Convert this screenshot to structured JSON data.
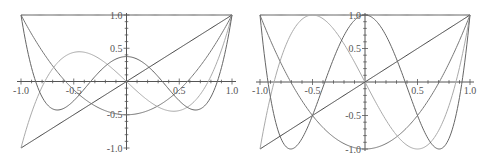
{
  "chart_data": [
    {
      "type": "line",
      "title": "Legendre polynomials P0–P4",
      "xlabel": "",
      "ylabel": "",
      "xlim": [
        -1,
        1
      ],
      "ylim": [
        -1,
        1
      ],
      "grid": false,
      "x_ticks": [
        "-1.0",
        "-0.5",
        "0.5",
        "1.0"
      ],
      "y_ticks": [
        "1.0",
        "0.5",
        "-0.5",
        "-1.0"
      ],
      "series": [
        {
          "name": "P0",
          "coeffs": [
            1
          ],
          "color": "#555555",
          "values_at": {
            "x": [
              -1,
              -0.5,
              0,
              0.5,
              1
            ],
            "y": [
              1,
              1,
              1,
              1,
              1
            ]
          }
        },
        {
          "name": "P1",
          "coeffs": [
            0,
            1
          ],
          "color": "#444444",
          "values_at": {
            "x": [
              -1,
              -0.5,
              0,
              0.5,
              1
            ],
            "y": [
              -1,
              -0.5,
              0,
              0.5,
              1
            ]
          }
        },
        {
          "name": "P2",
          "coeffs": [
            -0.5,
            0,
            1.5
          ],
          "color": "#777777",
          "values_at": {
            "x": [
              -1,
              -0.5,
              0,
              0.5,
              1
            ],
            "y": [
              1,
              -0.125,
              -0.5,
              -0.125,
              1
            ]
          }
        },
        {
          "name": "P3",
          "coeffs": [
            0,
            -1.5,
            0,
            2.5
          ],
          "color": "#aaaaaa",
          "values_at": {
            "x": [
              -1,
              -0.5,
              0,
              0.5,
              1
            ],
            "y": [
              -1,
              0.4375,
              0,
              -0.4375,
              1
            ]
          }
        },
        {
          "name": "P4",
          "coeffs": [
            0.375,
            0,
            -3.75,
            0,
            4.375
          ],
          "color": "#666666",
          "values_at": {
            "x": [
              -1,
              -0.5,
              0,
              0.5,
              1
            ],
            "y": [
              1,
              -0.289,
              0.375,
              -0.289,
              1
            ]
          }
        }
      ],
      "frame": {
        "x0": 21,
        "x1": 232,
        "y_top": 15,
        "y_bottom": 148
      }
    },
    {
      "type": "line",
      "title": "Chebyshev polynomials T0–T4",
      "xlabel": "",
      "ylabel": "",
      "xlim": [
        -1,
        1
      ],
      "ylim": [
        -1,
        1
      ],
      "grid": false,
      "x_ticks": [
        "-1.0",
        "-0.5",
        "0.5",
        "1.0"
      ],
      "y_ticks": [
        "1.0",
        "0.5",
        "-0.5",
        "-1.0"
      ],
      "series": [
        {
          "name": "T0",
          "coeffs": [
            1
          ],
          "color": "#555555",
          "values_at": {
            "x": [
              -1,
              -0.5,
              0,
              0.5,
              1
            ],
            "y": [
              1,
              1,
              1,
              1,
              1
            ]
          }
        },
        {
          "name": "T1",
          "coeffs": [
            0,
            1
          ],
          "color": "#444444",
          "values_at": {
            "x": [
              -1,
              -0.5,
              0,
              0.5,
              1
            ],
            "y": [
              -1,
              -0.5,
              0,
              0.5,
              1
            ]
          }
        },
        {
          "name": "T2",
          "coeffs": [
            -1,
            0,
            2
          ],
          "color": "#777777",
          "values_at": {
            "x": [
              -1,
              -0.5,
              0,
              0.5,
              1
            ],
            "y": [
              1,
              -0.5,
              -1,
              -0.5,
              1
            ]
          }
        },
        {
          "name": "T3",
          "coeffs": [
            0,
            -3,
            0,
            4
          ],
          "color": "#aaaaaa",
          "values_at": {
            "x": [
              -1,
              -0.5,
              0,
              0.5,
              1
            ],
            "y": [
              -1,
              1,
              0,
              -1,
              1
            ]
          }
        },
        {
          "name": "T4",
          "coeffs": [
            1,
            0,
            -8,
            0,
            8
          ],
          "color": "#666666",
          "values_at": {
            "x": [
              -1,
              -0.5,
              0,
              0.5,
              1
            ],
            "y": [
              1,
              -0.5,
              1,
              -0.5,
              1
            ]
          }
        }
      ],
      "frame": {
        "x0": 260,
        "x1": 470,
        "y_top": 15,
        "y_bottom": 149
      }
    }
  ]
}
